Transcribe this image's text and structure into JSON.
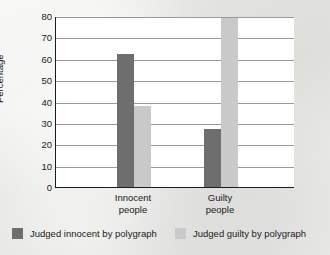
{
  "chart_data": {
    "type": "bar",
    "title": "",
    "xlabel": "",
    "ylabel": "Percentage",
    "ylim": [
      0,
      80
    ],
    "yticks": [
      0,
      10,
      20,
      30,
      40,
      50,
      60,
      70,
      80
    ],
    "ytick_labels": [
      "0",
      "10",
      "20",
      "30",
      "40",
      "50",
      "60",
      "70",
      "80"
    ],
    "grid": true,
    "legend_position": "bottom",
    "categories": [
      "Innocent people",
      "Guilty people"
    ],
    "category_lines": [
      [
        "Innocent",
        "people"
      ],
      [
        "Guilty",
        "people"
      ]
    ],
    "series": [
      {
        "name": "Judged innocent by polygraph",
        "color": "#6e6e6e",
        "values": [
          62,
          27
        ]
      },
      {
        "name": "Judged guilty by polygraph",
        "color": "#c9c9c9",
        "values": [
          38,
          79
        ]
      }
    ]
  },
  "legend": {
    "entries": [
      {
        "label": "Judged innocent by polygraph",
        "color": "#6e6e6e"
      },
      {
        "label": "Judged guilty by polygraph",
        "color": "#c9c9c9"
      }
    ]
  },
  "colors": {
    "page_background": "#e9e9e7",
    "plot_background": "#ffffff",
    "axis": "#1c1c1c",
    "gridline": "#9a9a9a",
    "series_dark": "#6e6e6e",
    "series_light": "#c9c9c9",
    "text": "#1a1a1a"
  }
}
